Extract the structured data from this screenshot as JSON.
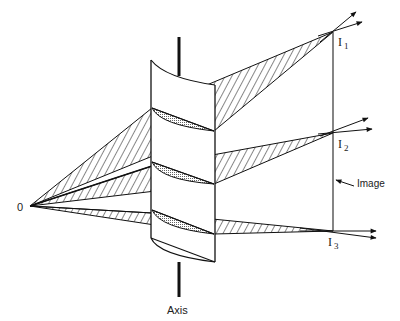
{
  "figure": {
    "type": "optics-diagram",
    "colors": {
      "ink": "#111111",
      "background": "#ffffff",
      "slice_fill": "#c8c8c8"
    }
  },
  "labels": {
    "object": "0",
    "axis": "Axis",
    "image": "Image",
    "image_points": [
      {
        "letter": "I",
        "index": "1"
      },
      {
        "letter": "I",
        "index": "2"
      },
      {
        "letter": "I",
        "index": "3"
      }
    ]
  }
}
